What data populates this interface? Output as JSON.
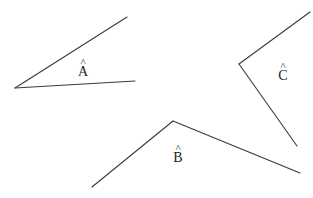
{
  "diagram": {
    "type": "angles",
    "stroke_color": "#3a3a3a",
    "angles": [
      {
        "name": "A",
        "label": "A",
        "hat": "^",
        "vertex": [
          15,
          88
        ],
        "arm1": [
          127,
          17
        ],
        "arm2": [
          135,
          81
        ],
        "label_pos": [
          83,
          59
        ]
      },
      {
        "name": "B",
        "label": "B",
        "hat": "^",
        "vertex": [
          173,
          121
        ],
        "arm1": [
          92,
          187
        ],
        "arm2": [
          300,
          173
        ],
        "label_pos": [
          178,
          145
        ]
      },
      {
        "name": "C",
        "label": "C",
        "hat": "^",
        "vertex": [
          239,
          64
        ],
        "arm1": [
          310,
          12
        ],
        "arm2": [
          297,
          146
        ],
        "label_pos": [
          283,
          63
        ]
      }
    ]
  }
}
